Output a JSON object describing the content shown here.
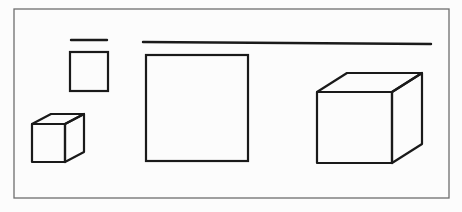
{
  "figure": {
    "colors": {
      "background": "#fcfcfc",
      "frame": "#6e6e6e",
      "stroke": "#1a1a1a"
    },
    "frame": {
      "x": 14,
      "y": 9,
      "width": 435,
      "height": 189
    },
    "lines": [
      {
        "name": "short-line",
        "x1": 71,
        "y1": 40,
        "x2": 107,
        "y2": 40
      },
      {
        "name": "long-line",
        "x1": 143,
        "y1": 42,
        "x2": 431,
        "y2": 44
      }
    ],
    "squares": [
      {
        "name": "small-square",
        "x": 70,
        "y": 52,
        "width": 38,
        "height": 39
      },
      {
        "name": "large-square",
        "x": 146,
        "y": 55,
        "width": 102,
        "height": 106
      }
    ],
    "cubes": [
      {
        "name": "small-cube",
        "front": {
          "x": 32,
          "y": 124,
          "width": 33,
          "height": 38
        },
        "back_offset": {
          "dx": 19,
          "dy": -10
        }
      },
      {
        "name": "large-cube",
        "front": {
          "x": 317,
          "y": 92,
          "width": 75,
          "height": 71
        },
        "back_offset": {
          "dx": 30,
          "dy": -19
        }
      }
    ],
    "caption_fragment": ""
  }
}
